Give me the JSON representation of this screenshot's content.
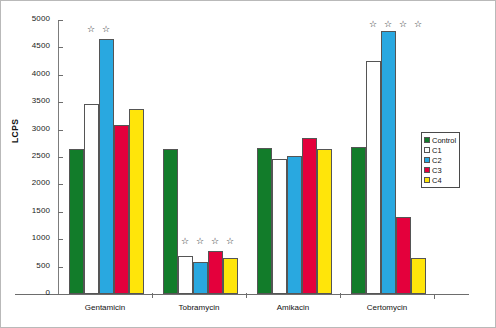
{
  "chart_data": {
    "type": "bar",
    "title": "",
    "xlabel": "",
    "ylabel": "LCPS",
    "ylim": [
      0,
      5000
    ],
    "ytick_step": 500,
    "grid": false,
    "legend_position": "right",
    "categories": [
      "Gentamicin",
      "Tobramycin",
      "Amikacin",
      "Certomycin"
    ],
    "yticks": [
      "0",
      "500",
      "1000",
      "1500",
      "2000",
      "2500",
      "3000",
      "3500",
      "4000",
      "4500",
      "5000"
    ],
    "series": [
      {
        "name": "Control",
        "color": "#127c2a",
        "values": [
          2650,
          2650,
          2670,
          2680
        ]
      },
      {
        "name": "C1",
        "color": "#ffffff",
        "values": [
          3470,
          700,
          2470,
          4250
        ]
      },
      {
        "name": "C2",
        "color": "#29a8e0",
        "values": [
          4650,
          580,
          2510,
          4800
        ]
      },
      {
        "name": "C3",
        "color": "#e4003c",
        "values": [
          3080,
          790,
          2850,
          1400
        ]
      },
      {
        "name": "C4",
        "color": "#ffe50a",
        "values": [
          3380,
          650,
          2650,
          660
        ]
      }
    ],
    "annotations": {
      "marker": "☆",
      "marker_name": "significance-star",
      "significance": [
        [
          false,
          true,
          true,
          false,
          false
        ],
        [
          false,
          true,
          true,
          true,
          true
        ],
        [
          false,
          false,
          false,
          false,
          false
        ],
        [
          false,
          true,
          true,
          true,
          true
        ]
      ]
    }
  },
  "legend": {
    "entries": [
      {
        "label": "Control",
        "color": "#127c2a"
      },
      {
        "label": "C1",
        "color": "#ffffff"
      },
      {
        "label": "C2",
        "color": "#29a8e0"
      },
      {
        "label": "C3",
        "color": "#e4003c"
      },
      {
        "label": "C4",
        "color": "#ffe50a"
      }
    ]
  }
}
